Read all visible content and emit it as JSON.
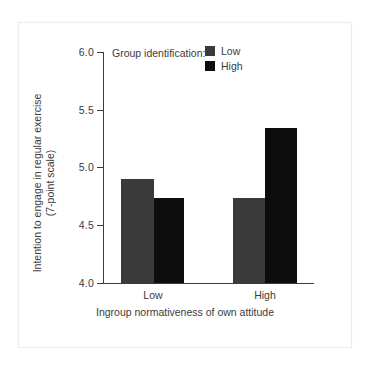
{
  "figure": {
    "background": "#ffffff",
    "panel_border": "#ececec"
  },
  "legend": {
    "title": "Group identification:",
    "entries": [
      {
        "label": "Low",
        "color": "#3a3a3a",
        "swatch_name": "legend-swatch-low"
      },
      {
        "label": "High",
        "color": "#0d0d0d",
        "swatch_name": "legend-swatch-high"
      }
    ]
  },
  "axes": {
    "y_title_line1": "Intention to engage in regular exercise",
    "y_title_line2": "(7-point scale)",
    "x_title": "Ingroup normativeness of own attitude",
    "y_ticks": [
      "4.0",
      "4.5",
      "5.0",
      "5.5",
      "6.0"
    ],
    "x_ticks": [
      "Low",
      "High"
    ]
  },
  "chart_data": {
    "type": "bar",
    "title": "",
    "xlabel": "Ingroup normativeness of own attitude",
    "ylabel": "Intention to engage in regular exercise (7-point scale)",
    "categories": [
      "Low",
      "High"
    ],
    "series": [
      {
        "name": "Low",
        "color": "#3a3a3a",
        "values": [
          4.9,
          4.74
        ]
      },
      {
        "name": "High",
        "color": "#0d0d0d",
        "values": [
          4.74,
          5.34
        ]
      }
    ],
    "ylim": [
      4.0,
      6.0
    ],
    "yticks": [
      4.0,
      4.5,
      5.0,
      5.5,
      6.0
    ],
    "ytick_labels": [
      "4.0",
      "4.5",
      "5.0",
      "5.5",
      "6.0"
    ],
    "grid": false,
    "legend_title": "Group identification:",
    "legend_position": "top-center"
  }
}
